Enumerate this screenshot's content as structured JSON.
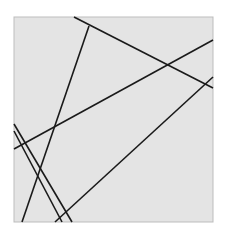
{
  "figure": {
    "width": 226,
    "height": 236,
    "background": "#ffffff",
    "panel": {
      "x": 14,
      "y": 17,
      "width": 199,
      "height": 205,
      "fill": "#e4e4e4",
      "stroke": "#bdbdbd"
    },
    "line_color": "#1a1a1a",
    "line_width": 1.6,
    "lines": [
      {
        "x1": 74,
        "y1": 17,
        "x2": 213,
        "y2": 88
      },
      {
        "x1": 89,
        "y1": 26,
        "x2": 22,
        "y2": 222
      },
      {
        "x1": 14,
        "y1": 149,
        "x2": 213,
        "y2": 40
      },
      {
        "x1": 14,
        "y1": 124,
        "x2": 72,
        "y2": 222
      },
      {
        "x1": 14,
        "y1": 131,
        "x2": 62,
        "y2": 222
      },
      {
        "x1": 55,
        "y1": 222,
        "x2": 213,
        "y2": 77
      }
    ]
  }
}
